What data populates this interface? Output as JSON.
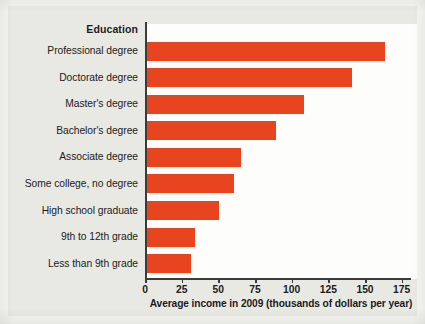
{
  "chart_data": {
    "type": "bar",
    "orientation": "horizontal",
    "title": "",
    "category_axis_title": "Education",
    "xlabel": "Average income in 2009 (thousands of dollars per year)",
    "ylabel": "Education",
    "xlim": [
      0,
      180
    ],
    "xticks": [
      0,
      25,
      50,
      75,
      100,
      125,
      150,
      175
    ],
    "xtick_labels": [
      "0",
      "25",
      "50",
      "75",
      "100",
      "125",
      "150",
      "175"
    ],
    "grid": false,
    "legend": false,
    "bar_color": "#e8441f",
    "plot_background": "#fdfdfb",
    "figure_background": "#e9e9e4",
    "axis_color": "#3b3b3b",
    "categories": [
      "Professional degree",
      "Doctorate degree",
      "Master's degree",
      "Bachelor's degree",
      "Associate degree",
      "Some college, no degree",
      "High school graduate",
      "9th to 12th grade",
      "Less than 9th grade"
    ],
    "values": [
      162,
      140,
      107,
      88,
      64,
      59,
      49,
      33,
      30
    ],
    "units": "thousands of dollars per year"
  }
}
